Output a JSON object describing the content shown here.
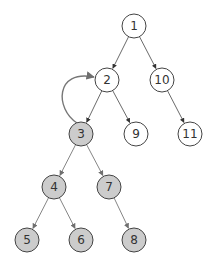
{
  "diagram": {
    "type": "tree",
    "colors": {
      "node_stroke": "#444444",
      "node_fill_default": "#ffffff",
      "node_fill_highlight": "#cccccc",
      "edge_dark": "#444444",
      "edge_gray": "#777777",
      "text": "#333333"
    },
    "node_radius": 12,
    "nodes": [
      {
        "id": "1",
        "label": "1",
        "x": 134,
        "y": 26,
        "highlighted": false
      },
      {
        "id": "2",
        "label": "2",
        "x": 107,
        "y": 80,
        "highlighted": false
      },
      {
        "id": "10",
        "label": "10",
        "x": 162,
        "y": 80,
        "highlighted": false
      },
      {
        "id": "3",
        "label": "3",
        "x": 81,
        "y": 134,
        "highlighted": true
      },
      {
        "id": "9",
        "label": "9",
        "x": 136,
        "y": 134,
        "highlighted": false
      },
      {
        "id": "11",
        "label": "11",
        "x": 190,
        "y": 134,
        "highlighted": false
      },
      {
        "id": "4",
        "label": "4",
        "x": 54,
        "y": 187,
        "highlighted": true
      },
      {
        "id": "7",
        "label": "7",
        "x": 109,
        "y": 187,
        "highlighted": true
      },
      {
        "id": "5",
        "label": "5",
        "x": 27,
        "y": 240,
        "highlighted": true
      },
      {
        "id": "6",
        "label": "6",
        "x": 81,
        "y": 240,
        "highlighted": true
      },
      {
        "id": "8",
        "label": "8",
        "x": 134,
        "y": 240,
        "highlighted": true
      }
    ],
    "edges": [
      {
        "from": "1",
        "to": "2",
        "style": "dark"
      },
      {
        "from": "1",
        "to": "10",
        "style": "dark"
      },
      {
        "from": "2",
        "to": "3",
        "style": "dark"
      },
      {
        "from": "2",
        "to": "9",
        "style": "dark"
      },
      {
        "from": "10",
        "to": "11",
        "style": "dark"
      },
      {
        "from": "3",
        "to": "4",
        "style": "gray"
      },
      {
        "from": "3",
        "to": "7",
        "style": "gray"
      },
      {
        "from": "4",
        "to": "5",
        "style": "gray"
      },
      {
        "from": "4",
        "to": "6",
        "style": "gray"
      },
      {
        "from": "7",
        "to": "8",
        "style": "gray"
      }
    ],
    "back_edges": [
      {
        "from": "3",
        "to": "2",
        "style": "gray",
        "curved": true
      }
    ]
  }
}
